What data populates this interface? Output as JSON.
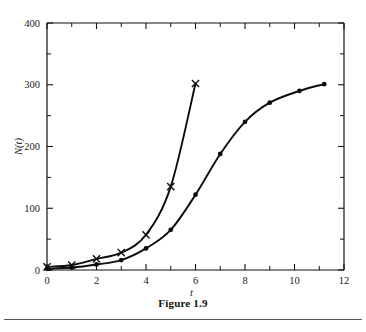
{
  "figure": {
    "caption": "Figure 1.9"
  },
  "chart_data": {
    "type": "line",
    "title": "",
    "xlabel": "t",
    "ylabel": "N(t)",
    "xlim": [
      0,
      12
    ],
    "ylim": [
      0,
      400
    ],
    "grid": false,
    "legend": "none",
    "x_ticks": [
      0,
      2,
      4,
      6,
      8,
      10,
      12
    ],
    "x_tick_labels": [
      "0",
      "2",
      "4",
      "6",
      "8",
      "10",
      "12"
    ],
    "x_minor_ticks": [
      1,
      3,
      5,
      7,
      9,
      11
    ],
    "y_ticks": [
      0,
      100,
      200,
      300,
      400
    ],
    "y_tick_labels": [
      "0",
      "100",
      "200",
      "300",
      "400"
    ],
    "y_minor_ticks": [
      50,
      150,
      250,
      350
    ],
    "series": [
      {
        "name": "exponential-growth",
        "marker": "cross",
        "x": [
          0,
          1,
          2,
          3,
          4,
          5,
          6
        ],
        "values": [
          5,
          8,
          18,
          28,
          57,
          135,
          302
        ]
      },
      {
        "name": "logistic-growth",
        "marker": "dot",
        "x": [
          0,
          1,
          2,
          3,
          4,
          5,
          6,
          7,
          8,
          9,
          10.2,
          11.2
        ],
        "values": [
          2,
          4,
          9,
          16,
          35,
          65,
          122,
          188,
          240,
          271,
          290,
          301
        ]
      }
    ]
  }
}
